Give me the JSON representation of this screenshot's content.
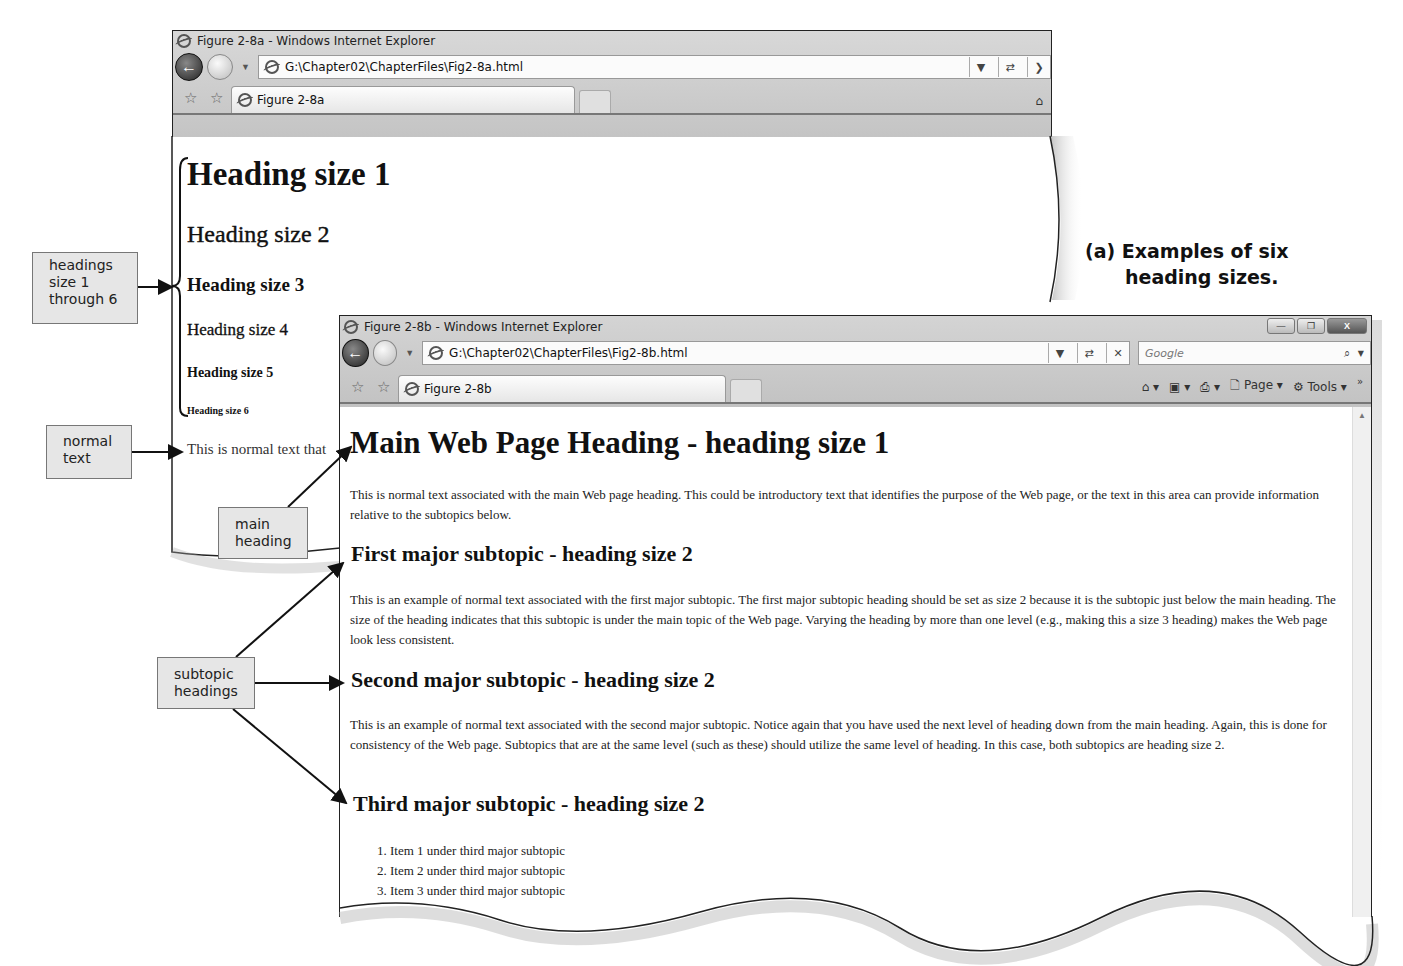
{
  "window_a": {
    "title": "Figure 2-8a - Windows Internet Explorer",
    "address": "G:\\Chapter02\\ChapterFiles\\Fig2-8a.html",
    "tab_label": "Figure 2-8a",
    "icons": [
      "ie-icon",
      "back-icon",
      "forward-icon",
      "favorites-star-icon",
      "add-favorites-icon",
      "home-icon",
      "refresh-icon",
      "stop-icon"
    ],
    "headings": [
      {
        "level": 1,
        "text": "Heading size 1"
      },
      {
        "level": 2,
        "text": "Heading size 2"
      },
      {
        "level": 3,
        "text": "Heading size 3"
      },
      {
        "level": 4,
        "text": "Heading size 4"
      },
      {
        "level": 5,
        "text": "Heading size 5"
      },
      {
        "level": 6,
        "text": "Heading size 6"
      }
    ],
    "normal_text": "This is normal text that"
  },
  "window_b": {
    "title": "Figure 2-8b - Windows Internet Explorer",
    "address": "G:\\Chapter02\\ChapterFiles\\Fig2-8b.html",
    "tab_label": "Figure 2-8b",
    "search_placeholder": "Google",
    "toolbar": {
      "page_label": "Page",
      "tools_label": "Tools",
      "more": "»"
    },
    "window_controls": {
      "minimize": "—",
      "restore": "❐",
      "close": "X"
    },
    "page": {
      "h1": "Main Web Page Heading - heading size 1",
      "intro": "This is normal text associated with the main Web page heading. This could be introductory text that identifies the purpose of the Web page, or the text in this area can provide information relative to the subtopics below.",
      "sections": [
        {
          "heading": "First major subtopic - heading size 2",
          "text": "This is an example of normal text associated with the first major subtopic. The first major subtopic heading should be set as size 2 because it is the subtopic just below the main heading. The size of the heading indicates that this subtopic is under the main topic of the Web page. Varying the heading by more than one level (e.g., making this a size 3 heading) makes the Web page look less consistent."
        },
        {
          "heading": "Second major subtopic - heading size 2",
          "text": "This is an example of normal text associated with the second major subtopic. Notice again that you have used the next level of heading down from the main heading. Again, this is done for consistency of the Web page. Subtopics that are at the same level (such as these) should utilize the same level of heading. In this case, both subtopics are heading size 2."
        },
        {
          "heading": "Third major subtopic - heading size 2",
          "list": [
            "Item 1 under third major subtopic",
            "Item 2 under third major subtopic",
            "Item 3 under third major subtopic"
          ]
        }
      ]
    }
  },
  "callouts": {
    "headings_range": [
      "headings",
      "size 1",
      "through 6"
    ],
    "normal_text": [
      "normal",
      "text"
    ],
    "main_heading": [
      "main",
      "heading"
    ],
    "subtopic_headings": [
      "subtopic",
      "headings"
    ]
  },
  "caption": {
    "line1": "(a) Examples of six",
    "line2": "heading sizes."
  },
  "colors": {
    "chrome": "#c8c8c8",
    "callout_bg": "#e6e6e6",
    "text": "#111111"
  }
}
